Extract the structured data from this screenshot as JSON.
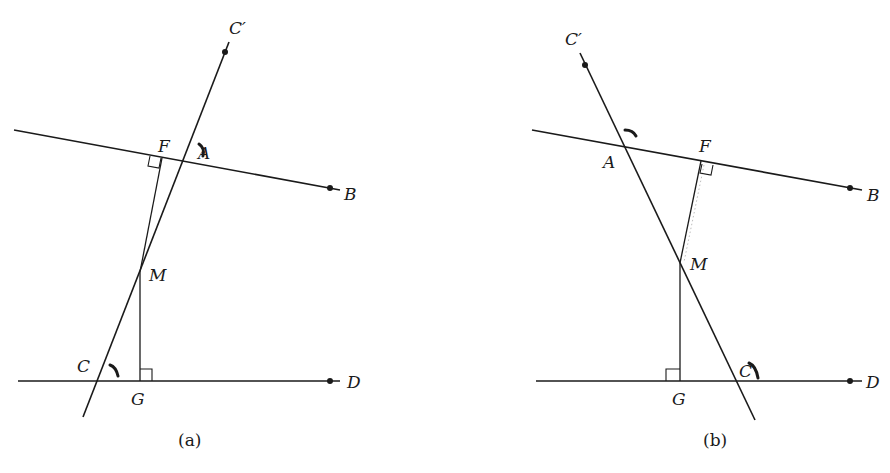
{
  "figure": {
    "panels": [
      {
        "id": "a",
        "caption": "(a)",
        "labels": {
          "C_prime": "C′",
          "F": "F",
          "A": "A",
          "B": "B",
          "M": "M",
          "C": "C",
          "G": "G",
          "D": "D"
        },
        "description": "Transversal C′C crosses line AB at A and line CD at C; M is a point on the transversal; MF ⟂ AB at F and MG ⟂ CD at G."
      },
      {
        "id": "b",
        "caption": "(b)",
        "labels": {
          "C_prime": "C′",
          "F": "F",
          "A": "A",
          "B": "B",
          "M": "M",
          "C": "C",
          "G": "G",
          "D": "D"
        },
        "description": "Mirror configuration: transversal C′C slopes the other way, crossing AB at A and CD at C; MF ⟂ AB at F and MG ⟂ CD at G."
      }
    ],
    "colors": {
      "ink": "#1a1a1a",
      "background": "#ffffff"
    }
  }
}
